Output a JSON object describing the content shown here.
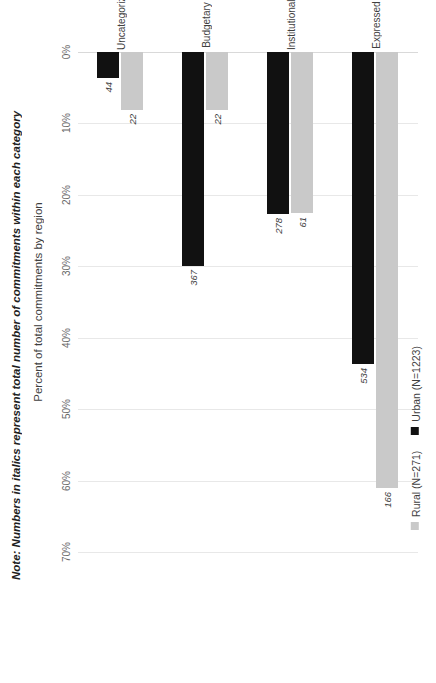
{
  "chart_data": {
    "type": "bar",
    "orientation": "horizontal",
    "title": "",
    "xlabel": "",
    "ylabel": "Percent of total commitments by region",
    "ylim": [
      0,
      70
    ],
    "grid": true,
    "legend_position": "bottom",
    "categories": [
      "Expressed",
      "Institutional",
      "Budgetary",
      "Uncategorized"
    ],
    "tick_labels": [
      "0%",
      "10%",
      "20%",
      "30%",
      "40%",
      "50%",
      "60%",
      "70%"
    ],
    "tick_values": [
      0,
      10,
      20,
      30,
      40,
      50,
      60,
      70
    ],
    "series": [
      {
        "name": "Rural (N=271)",
        "color": "#c9c9c9",
        "values": [
          61.0,
          22.5,
          8.1,
          8.1
        ],
        "point_labels": [
          "166",
          "61",
          "22",
          "22"
        ]
      },
      {
        "name": "Urban (N=1223)",
        "color": "#111111",
        "values": [
          43.7,
          22.7,
          30.0,
          3.6
        ],
        "point_labels": [
          "534",
          "278",
          "367",
          "44"
        ]
      }
    ],
    "note": "Note: Numbers in italics represent total number of commitments within each category"
  },
  "axis": {
    "value_axis_title": "Percent of total commitments by region"
  },
  "legend": {
    "items": [
      {
        "label": "Rural (N=271)",
        "swatch": "legend-swatch-rural"
      },
      {
        "label": "Urban (N=1223)",
        "swatch": "legend-swatch-urban"
      }
    ]
  },
  "note": {
    "text": "Note: Numbers in italics represent total number of commitments within each category"
  },
  "colors": {
    "rural": "#c9c9c9",
    "urban": "#111111",
    "gridline": "#e8e8e8",
    "text": "#3f3f3f",
    "background": "#ffffff"
  }
}
